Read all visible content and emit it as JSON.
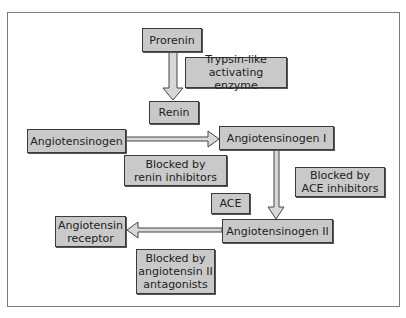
{
  "diagram": {
    "nodes": {
      "prorenin": "Prorenin",
      "trypsin": "Trypsin-like\nactivating enzyme",
      "renin": "Renin",
      "angiotensinogen": "Angiotensinogen",
      "ang1": "Angiotensinogen I",
      "renin_block": "Blocked by\nrenin inhibitors",
      "ace_block": "Blocked by\nACE inhibitors",
      "ace": "ACE",
      "ang2": "Angiotensinogen II",
      "receptor": "Angiotensin\nreceptor",
      "antag_block": "Blocked by\nangiotensin II\nantagonists"
    },
    "edges": [
      {
        "from": "Prorenin",
        "to": "Renin"
      },
      {
        "from": "Angiotensinogen",
        "to": "Angiotensinogen I"
      },
      {
        "from": "Angiotensinogen I",
        "to": "Angiotensinogen II"
      },
      {
        "from": "Angiotensinogen II",
        "to": "Angiotensin receptor"
      }
    ],
    "colors": {
      "box_fill": "#c9c9c9",
      "box_border": "#3a3a3a",
      "frame": "#7a7a7a"
    }
  }
}
